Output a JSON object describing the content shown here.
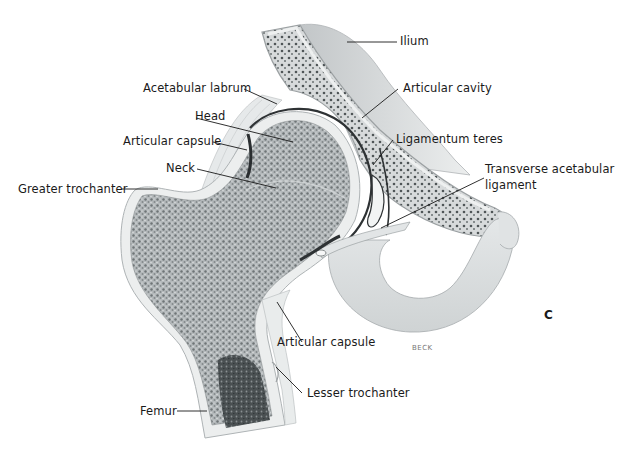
{
  "figure": {
    "plate_letter": "C",
    "signature": "BECK"
  },
  "labels": [
    {
      "id": "ilium",
      "text": "Ilium"
    },
    {
      "id": "acetabular-labrum",
      "text": "Acetabular labrum"
    },
    {
      "id": "articular-cavity",
      "text": "Articular cavity"
    },
    {
      "id": "head",
      "text": "Head"
    },
    {
      "id": "articular-capsule-upper",
      "text": "Articular capsule"
    },
    {
      "id": "ligamentum-teres",
      "text": "Ligamentum teres"
    },
    {
      "id": "neck",
      "text": "Neck"
    },
    {
      "id": "transverse-acetabular-ligament-1",
      "text": "Transverse acetabular"
    },
    {
      "id": "transverse-acetabular-ligament-2",
      "text": "ligament"
    },
    {
      "id": "greater-trochanter",
      "text": "Greater trochanter"
    },
    {
      "id": "articular-capsule-lower",
      "text": "Articular capsule"
    },
    {
      "id": "lesser-trochanter",
      "text": "Lesser trochanter"
    },
    {
      "id": "femur",
      "text": "Femur"
    }
  ],
  "colors": {
    "cortical_bone": "#e9ecec",
    "spongy_bone": "#9aa0a2",
    "spongy_dark": "#5e6466",
    "marrow": "#3c4244",
    "cartilage": "#d8dcdc",
    "ilium_surface": "#c9cdcf",
    "leader_line": "#1a1a1a"
  }
}
